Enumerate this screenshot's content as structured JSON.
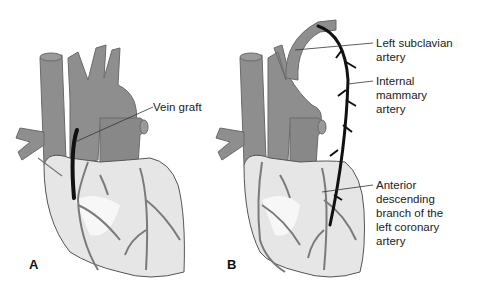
{
  "figure": {
    "panels": [
      {
        "letter": "A",
        "labels": [
          {
            "text": "Vein graft"
          }
        ]
      },
      {
        "letter": "B",
        "labels": [
          {
            "text": "Left subclavian\nartery"
          },
          {
            "text": "Internal\nmammary\nartery"
          },
          {
            "text": "Anterior\ndescending\nbranch of the\nleft coronary\nartery"
          }
        ]
      }
    ],
    "colors": {
      "vessel": "#8e8e8e",
      "heart_fill": "#e6e6e6",
      "heart_highlight": "#f7f7f7",
      "outline": "#555555",
      "graft": "#111111"
    }
  }
}
